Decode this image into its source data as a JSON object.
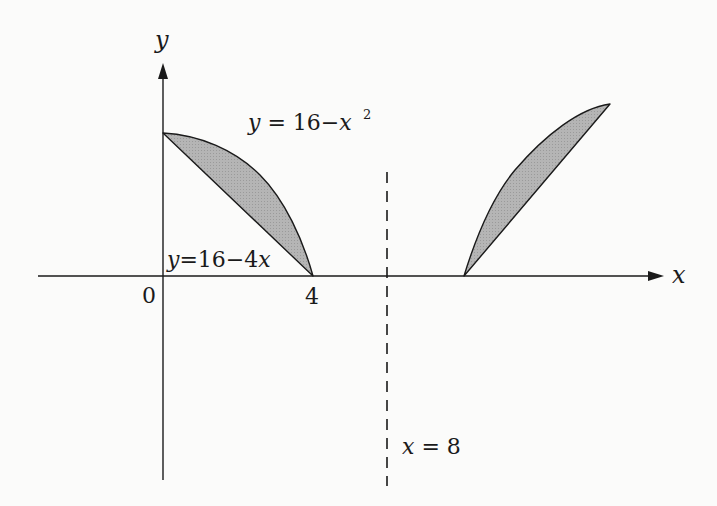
{
  "diagram": {
    "axes": {
      "x_label": "x",
      "y_label": "y",
      "origin_label": "0",
      "tick_label_4": "4"
    },
    "curves": {
      "parabola_label": "y = 16−x²",
      "parabola_label_main": "y = 16−x",
      "parabola_label_sup": "2",
      "line_label": "y=16−4x"
    },
    "axis_of_rotation": {
      "label": "x = 8",
      "style": "dashed"
    },
    "region": {
      "description": "Region between y=16-x^2 and y=16-4x for 0<=x<=4, reflected about x=8",
      "fill_color": "#b8b8b8",
      "stroke_color": "#222222"
    },
    "colors": {
      "background": "#fbfbfa",
      "ink": "#1a1a1a",
      "shade": "#b8b8b8"
    }
  }
}
